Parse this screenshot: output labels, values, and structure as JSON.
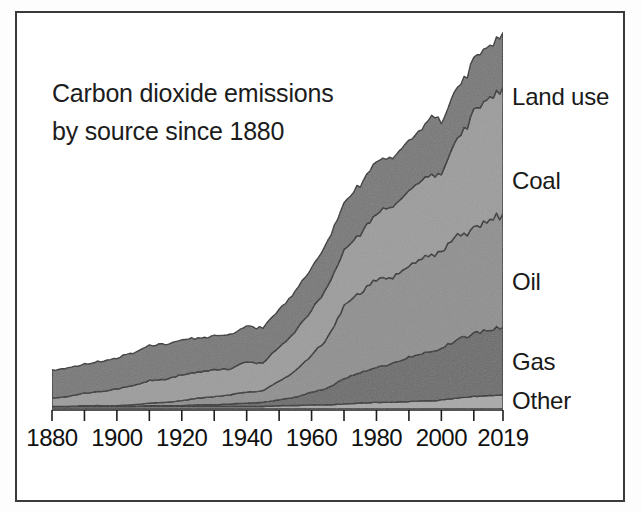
{
  "figure": {
    "title_line1": "Carbon dioxide emissions",
    "title_line2": "by source since 1880",
    "border_color": "#3a3a3c",
    "background": "#ffffff"
  },
  "chart_data": {
    "type": "area",
    "title": "Carbon dioxide emissions by source since 1880",
    "subtitle": "",
    "xlabel": "",
    "ylabel": "",
    "stacked": true,
    "grid": false,
    "legend_position": "right-edge-inline",
    "xlim": [
      1880,
      2019
    ],
    "ylim": [
      0,
      40
    ],
    "xticks": [
      1880,
      1890,
      1900,
      1910,
      1920,
      1930,
      1940,
      1950,
      1960,
      1970,
      1980,
      1990,
      2000,
      2010,
      2019
    ],
    "xtick_labels": [
      "1880",
      "1900",
      "1920",
      "1940",
      "1960",
      "1980",
      "2000",
      "2019"
    ],
    "xtick_label_values": [
      1880,
      1900,
      1920,
      1940,
      1960,
      1980,
      2000,
      2019
    ],
    "colors": {
      "Other": "#a8a8a8",
      "Gas": "#6b6b6b",
      "Oil": "#8f8f8f",
      "Coal": "#9c9c9c",
      "Land use": "#777777"
    },
    "x": [
      1880,
      1885,
      1890,
      1895,
      1900,
      1905,
      1910,
      1915,
      1920,
      1925,
      1930,
      1935,
      1940,
      1945,
      1950,
      1955,
      1960,
      1965,
      1970,
      1975,
      1980,
      1985,
      1990,
      1995,
      1998,
      2000,
      2005,
      2010,
      2015,
      2019
    ],
    "series": [
      {
        "name": "Other",
        "stack_order": 1,
        "values": [
          0.3,
          0.3,
          0.3,
          0.3,
          0.3,
          0.3,
          0.3,
          0.3,
          0.3,
          0.3,
          0.3,
          0.3,
          0.3,
          0.3,
          0.4,
          0.4,
          0.5,
          0.5,
          0.6,
          0.7,
          0.8,
          0.8,
          0.9,
          1.0,
          1.0,
          1.1,
          1.3,
          1.5,
          1.6,
          1.7
        ]
      },
      {
        "name": "Gas",
        "stack_order": 2,
        "values": [
          0.0,
          0.0,
          0.0,
          0.0,
          0.0,
          0.0,
          0.1,
          0.1,
          0.1,
          0.2,
          0.2,
          0.3,
          0.4,
          0.5,
          0.7,
          1.0,
          1.5,
          2.0,
          3.0,
          3.6,
          4.2,
          4.6,
          5.3,
          5.8,
          6.0,
          6.2,
          6.9,
          7.5,
          7.9,
          8.2
        ]
      },
      {
        "name": "Oil",
        "stack_order": 3,
        "values": [
          0.0,
          0.0,
          0.1,
          0.1,
          0.1,
          0.2,
          0.3,
          0.4,
          0.6,
          0.8,
          1.0,
          1.1,
          1.3,
          1.4,
          2.2,
          3.1,
          4.4,
          6.0,
          8.6,
          9.5,
          10.6,
          10.3,
          10.9,
          11.3,
          11.6,
          11.7,
          12.3,
          12.6,
          13.1,
          13.5
        ]
      },
      {
        "name": "Coal",
        "stack_order": 4,
        "values": [
          1.0,
          1.2,
          1.5,
          1.7,
          2.0,
          2.3,
          2.7,
          2.7,
          3.1,
          3.1,
          3.2,
          3.1,
          3.6,
          3.3,
          4.1,
          4.7,
          5.5,
          6.1,
          6.7,
          7.1,
          7.9,
          8.4,
          9.0,
          9.3,
          9.6,
          9.4,
          11.4,
          13.9,
          14.8,
          14.9
        ]
      },
      {
        "name": "Land use",
        "stack_order": 5,
        "values": [
          3.3,
          3.4,
          3.5,
          3.6,
          3.7,
          3.9,
          4.2,
          4.2,
          4.2,
          4.0,
          4.0,
          4.1,
          4.3,
          4.2,
          4.5,
          4.8,
          5.1,
          5.3,
          5.6,
          5.9,
          6.2,
          5.9,
          6.0,
          6.2,
          7.2,
          6.1,
          6.0,
          6.2,
          6.3,
          6.6
        ]
      }
    ],
    "series_labels": [
      {
        "name": "Land use",
        "label": "Land use"
      },
      {
        "name": "Coal",
        "label": "Coal"
      },
      {
        "name": "Oil",
        "label": "Oil"
      },
      {
        "name": "Gas",
        "label": "Gas"
      },
      {
        "name": "Other",
        "label": "Other"
      }
    ]
  }
}
